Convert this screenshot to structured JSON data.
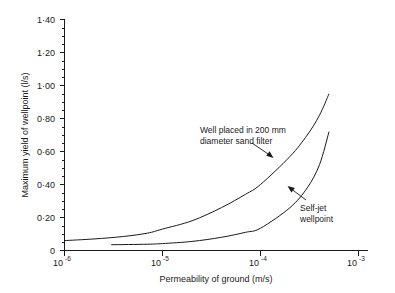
{
  "chart_data": {
    "type": "line",
    "title": "",
    "xlabel": "Permeability of ground (m/s)",
    "ylabel": "Maximum yield of wellpoint (l/s)",
    "x_scale": "log",
    "y_scale": "linear",
    "xlim": [
      1e-06,
      0.001
    ],
    "ylim": [
      0,
      1.4
    ],
    "grid": false,
    "legend_position": "none",
    "x_tick_labels": [
      "10⁻⁶",
      "10⁻⁵",
      "10⁻⁴",
      "10⁻³"
    ],
    "x_tick_bases": [
      "10",
      "10",
      "10",
      "10"
    ],
    "x_tick_exponents": [
      "-6",
      "-5",
      "-4",
      "-3"
    ],
    "x_tick_values": [
      1e-06,
      1e-05,
      0.0001,
      0.001
    ],
    "y_tick_labels": [
      "0",
      "0·20",
      "0·40",
      "0·60",
      "0·80",
      "1·00",
      "1·20",
      "1·40"
    ],
    "y_tick_values": [
      0,
      0.2,
      0.4,
      0.6,
      0.8,
      1.0,
      1.2,
      1.4
    ],
    "y_minor_step": 0.05,
    "series": [
      {
        "name": "Well placed in 200 mm diameter sand filter",
        "x": [
          1e-06,
          2e-06,
          4e-06,
          7e-06,
          1e-05,
          2e-05,
          4e-05,
          7e-05,
          0.0001,
          0.0002,
          0.0003,
          0.0004,
          0.0005
        ],
        "values": [
          0.06,
          0.07,
          0.085,
          0.105,
          0.13,
          0.18,
          0.26,
          0.34,
          0.4,
          0.57,
          0.7,
          0.82,
          0.95
        ]
      },
      {
        "name": "Self-jet wellpoint",
        "x": [
          3e-06,
          7e-06,
          1e-05,
          2e-05,
          4e-05,
          7e-05,
          0.0001,
          0.0002,
          0.0003,
          0.0004,
          0.0005
        ],
        "values": [
          0.035,
          0.038,
          0.042,
          0.055,
          0.08,
          0.11,
          0.135,
          0.26,
          0.38,
          0.52,
          0.72
        ]
      }
    ],
    "annotations": [
      {
        "name": "sand-filter-annotation",
        "lines": [
          "Well placed in 200 mm",
          "diameter sand filter"
        ],
        "text_x": 200,
        "text_y": 133,
        "leader_from_x": 252,
        "leader_from_y": 143,
        "leader_to_x": 273,
        "leader_to_y": 157
      },
      {
        "name": "self-jet-annotation",
        "lines": [
          "Self-jet",
          "wellpoint"
        ],
        "text_x": 300,
        "text_y": 211,
        "leader_from_x": 306,
        "leader_from_y": 200,
        "leader_to_x": 288,
        "leader_to_y": 186
      }
    ],
    "colors": {
      "curve": "#1a1a1a",
      "axis": "#1a1a1a",
      "background": "#ffffff"
    }
  }
}
